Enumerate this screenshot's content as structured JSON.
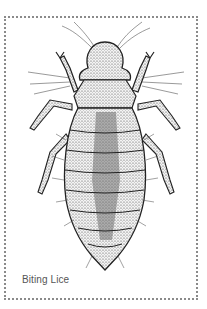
{
  "card": {
    "caption": "Biting Lice",
    "border_style": "dotted",
    "border_color": "#8a8a8a"
  },
  "illustration": {
    "subject": "biting louse insect, dorsal view",
    "style": "black and white stippled pen drawing"
  }
}
